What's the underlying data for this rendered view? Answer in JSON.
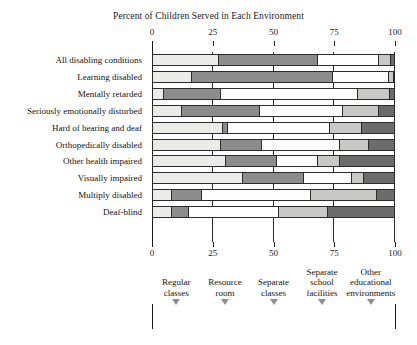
{
  "chart_data": {
    "type": "bar",
    "orientation": "horizontal",
    "stacked": true,
    "title": "Percent of Children Served in Each Environment",
    "xlabel": "",
    "ylabel": "",
    "xlim": [
      0,
      100
    ],
    "xticks": [
      0,
      25,
      50,
      75,
      100
    ],
    "xtick_labels": [
      "0",
      "25",
      "50",
      "75",
      "100"
    ],
    "grid": true,
    "legend_position": "bottom",
    "categories": [
      "All disabling conditions",
      "Learning disabled",
      "Mentally retarded",
      "Seriously emotionally disturbed",
      "Hard of hearing and deaf",
      "Orthopedically disabled",
      "Other health impaired",
      "Visually impaired",
      "Multiply disabled",
      "Deaf-blind"
    ],
    "series": [
      {
        "name": "Regular classes",
        "color": "#ebebe7",
        "values": [
          27,
          16,
          4.5,
          12,
          29,
          28,
          30,
          37,
          8,
          8
        ]
      },
      {
        "name": "Resource room",
        "color": "#8c8c8c",
        "values": [
          41,
          58,
          23.5,
          32,
          2,
          17,
          21,
          25,
          12,
          7
        ]
      },
      {
        "name": "Separate classes",
        "color": "#fdfdfd",
        "values": [
          25,
          23,
          56.5,
          34,
          42,
          32,
          17,
          20,
          45,
          37
        ]
      },
      {
        "name": "Separate school facilities",
        "color": "#c8c8c4",
        "values": [
          5,
          2,
          13,
          15,
          13,
          12,
          9,
          5,
          27,
          20
        ]
      },
      {
        "name": "Other educational environments",
        "color": "#6b6b6b",
        "values": [
          2,
          1,
          2.5,
          7,
          14,
          11,
          23,
          13,
          8,
          28
        ]
      }
    ]
  },
  "legend": {
    "label": "Legend",
    "items": [
      {
        "name": "Regular classes",
        "line1": "Regular",
        "line2": "classes",
        "color": "#ebebe7"
      },
      {
        "name": "Resource room",
        "line1": "Resource",
        "line2": "room",
        "color": "#8c8c8c"
      },
      {
        "name": "Separate classes",
        "line1": "Separate",
        "line2": "classes",
        "color": "#fdfdfd"
      },
      {
        "name": "Separate school facilities",
        "line1": "Separate",
        "line2": "school",
        "line3": "facilities",
        "color": "#c8c8c4"
      },
      {
        "name": "Other educational environments",
        "line1": "Other",
        "line2": "educational",
        "line3": "environments",
        "color": "#6b6b6b"
      }
    ]
  },
  "colors": {
    "axis": "#1a1a1a",
    "outline": "#2b2b2b",
    "background": "#ffffff",
    "arrow": "#8e8e8e"
  }
}
